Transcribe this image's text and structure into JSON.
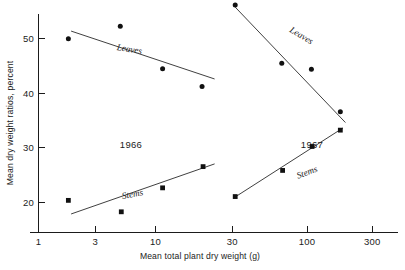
{
  "chart_data": {
    "type": "scatter",
    "title": "",
    "xlabel": "Mean total plant dry weight (g)",
    "ylabel": "Mean dry weight ratios, percent",
    "xscale": "log",
    "yscale": "linear",
    "xlim": [
      1,
      450
    ],
    "ylim": [
      15,
      58
    ],
    "grid": false,
    "legend": "inline-annotations",
    "xticks": [
      1,
      3,
      10,
      30,
      100,
      300
    ],
    "xticklabels": [
      "1",
      "3",
      "10",
      "30",
      "100",
      "300"
    ],
    "yticks": [
      20,
      30,
      40,
      50
    ],
    "yticklabels": [
      "20",
      "30",
      "40",
      "50"
    ],
    "panels": [
      {
        "name": "1966",
        "label": "1966",
        "series": [
          {
            "name": "Leaves",
            "label": "Leaves",
            "marker": "circle",
            "points": [
              {
                "x": 1.8,
                "y": 50.0
              },
              {
                "x": 5.0,
                "y": 52.3
              },
              {
                "x": 11.5,
                "y": 44.5
              },
              {
                "x": 25.0,
                "y": 41.2
              }
            ],
            "fit_line": {
              "x0": 1.9,
              "y0": 51.4,
              "x1": 32.0,
              "y1": 42.6
            }
          },
          {
            "name": "Stems",
            "label": "Stems",
            "marker": "square",
            "points": [
              {
                "x": 1.8,
                "y": 20.3
              },
              {
                "x": 5.1,
                "y": 18.2
              },
              {
                "x": 11.5,
                "y": 22.6
              },
              {
                "x": 25.5,
                "y": 26.5
              }
            ],
            "fit_line": {
              "x0": 1.9,
              "y0": 17.8,
              "x1": 32.0,
              "y1": 27.0
            }
          }
        ]
      },
      {
        "name": "1967",
        "label": "1967",
        "series": [
          {
            "name": "Leaves",
            "label": "Leaves",
            "marker": "circle",
            "points": [
              {
                "x": 48.0,
                "y": 56.2
              },
              {
                "x": 120.0,
                "y": 45.5
              },
              {
                "x": 215.0,
                "y": 44.4
              },
              {
                "x": 380.0,
                "y": 36.6
              }
            ],
            "fit_line": {
              "x0": 48.0,
              "y0": 55.8,
              "x1": 420.0,
              "y1": 34.6
            }
          },
          {
            "name": "Stems",
            "label": "Stems",
            "marker": "square",
            "points": [
              {
                "x": 48.0,
                "y": 21.0
              },
              {
                "x": 122.0,
                "y": 25.8
              },
              {
                "x": 218.0,
                "y": 30.2
              },
              {
                "x": 380.0,
                "y": 33.2
              }
            ],
            "fit_line": {
              "x0": 47.0,
              "y0": 20.8,
              "x1": 400.0,
              "y1": 33.6
            }
          }
        ]
      }
    ]
  },
  "axes": {
    "y_title": "Mean dry weight ratios, percent",
    "x_title": "Mean total plant dry weight (g)",
    "y_tick_1": "20",
    "y_tick_2": "30",
    "y_tick_3": "40",
    "y_tick_4": "50",
    "x_tick_1": "1",
    "x_tick_2": "3",
    "x_tick_3": "10",
    "x_tick_4": "30",
    "x_tick_5": "100",
    "x_tick_6": "300"
  },
  "annotations": {
    "panel_1966": "1966",
    "panel_1967": "1967",
    "leaves_1966": "Leaves",
    "stems_1966": "Stems",
    "leaves_1967": "Leaves",
    "stems_1967": "Stems"
  },
  "colors": {
    "ink": "#1b1b1b",
    "marker": "#111111",
    "background": "#ffffff"
  }
}
